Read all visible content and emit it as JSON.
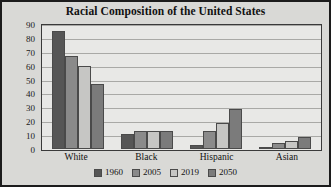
{
  "chart_data": {
    "type": "bar",
    "title": "Racial Composition of the United States",
    "xlabel": "",
    "ylabel": "",
    "ylim": [
      0,
      90
    ],
    "yticks": [
      0,
      10,
      20,
      30,
      40,
      50,
      60,
      70,
      80,
      90
    ],
    "grid": true,
    "legend_position": "bottom",
    "categories": [
      "White",
      "Black",
      "Hispanic",
      "Asian"
    ],
    "series": [
      {
        "name": "1960",
        "color": "#565656",
        "values": [
          85,
          11,
          3,
          0.5
        ]
      },
      {
        "name": "2005",
        "color": "#8a8a8a",
        "values": [
          67,
          13,
          13,
          4
        ]
      },
      {
        "name": "2019",
        "color": "#c6c6c4",
        "values": [
          60,
          13,
          19,
          6
        ]
      },
      {
        "name": "2050",
        "color": "#7b7b7b",
        "values": [
          47,
          13,
          29,
          9
        ]
      }
    ]
  }
}
